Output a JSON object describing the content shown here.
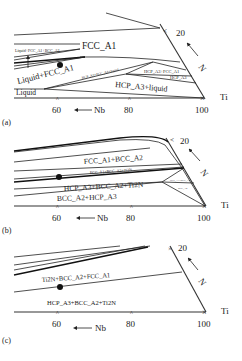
{
  "figure": {
    "panels": [
      {
        "id": "a",
        "caption": "(a)",
        "axis": {
          "ti_label": "Ti",
          "nb_label": "Nb",
          "n_label": "N",
          "ticks": [
            "60",
            "80",
            "100"
          ],
          "n_tick": "20"
        },
        "regions": {
          "fcc": "FCC_A1",
          "liq_fcc_bcc": "Liquid+FCC_A1+BCC_A2",
          "liq_fcc": "Liquid+FCC_A1",
          "hcp_fcc_liq": "HCP_A3+FCC_A1+liquid",
          "hcp_fcc": "HCP_A3+FCC_A1",
          "hcp": "HCP_A3",
          "hcp_liq": "HCP_A3+liquid",
          "liquid": "Liquid"
        }
      },
      {
        "id": "b",
        "caption": "(b)",
        "axis": {
          "ti_label": "Ti",
          "nb_label": "Nb",
          "n_label": "N",
          "ticks": [
            "60",
            "80",
            "100"
          ],
          "n_tick": "20"
        },
        "regions": {
          "fcc_bcc": "FCC_A1+BCC_A2",
          "fcc_bcc_ti2n": "FCC_A1+BCC_A2+Ti2N",
          "hcp_bcc_ti2n": "HCP_A3+BCC_A2+Ti2N",
          "bcc_hcp": "BCC_A2+HCP_A3",
          "small1": "HCP_A3+BCC_A2",
          "small2": "BCC_A2"
        }
      },
      {
        "id": "c",
        "caption": "(c)",
        "axis": {
          "ti_label": "Ti",
          "nb_label": "Nb",
          "n_label": "N",
          "ticks": [
            "60",
            "80",
            "100"
          ],
          "n_tick": "20"
        },
        "regions": {
          "ti2n_bcc_fcc": "Ti2N+BCC_A2+FCC_A1",
          "hcp_bcc_ti2n": "HCP_A3+BCC_A2+Ti2N"
        }
      }
    ]
  }
}
